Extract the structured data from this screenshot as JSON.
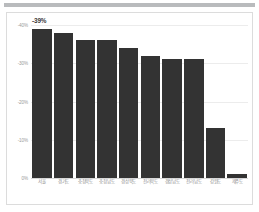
{
  "chart_data": {
    "type": "bar",
    "title": "",
    "subtitle": "",
    "xlabel": "",
    "ylabel": "",
    "categories": [
      "서울",
      "경기도",
      "충청북도",
      "충청남도",
      "경상북도",
      "전라북도",
      "경상남도",
      "전라남도",
      "강원도",
      "제주도"
    ],
    "values": [
      -39,
      -38,
      -36,
      -36,
      -34,
      -32,
      -31,
      -31,
      -13,
      -1
    ],
    "ylim": [
      -40,
      0
    ],
    "yticks": [
      -40,
      -30,
      -20,
      -10,
      0
    ],
    "ytick_labels": [
      "-40%",
      "-30%",
      "-20%",
      "-10%",
      "0%"
    ],
    "data_labels": [
      {
        "index": 0,
        "text": "-39%"
      }
    ],
    "grid": true,
    "legend": null,
    "bar_color": "#333333",
    "grid_color": "#ececec",
    "axis_text_color": "#9a9a9a",
    "panel_border_color": "#dcdcdc",
    "background": "#ffffff"
  }
}
